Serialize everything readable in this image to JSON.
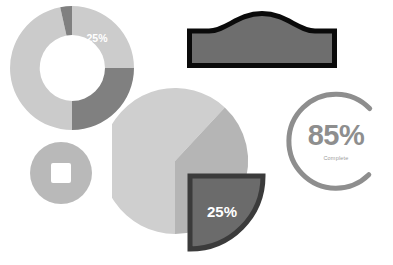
{
  "canvas": {
    "width": 393,
    "height": 265,
    "background": "#ffffff"
  },
  "palette": {
    "light_gray": "#cccccc",
    "lighter_gray": "#d4d4d4",
    "mid_gray": "#b0b0b0",
    "dark_gray": "#787878",
    "darker_gray": "#6e6e6e",
    "outline_dark": "#3b3b3b",
    "black": "#0a0a0a",
    "ring_gray": "#8e8e8e",
    "white": "#ffffff"
  },
  "widgets": {
    "donut_chart": {
      "name": "donut-chart",
      "label": "25%",
      "label_color": "#ffffff",
      "center_x": 64,
      "center_y": 64,
      "outer_radius": 62,
      "inner_radius": 33,
      "segments": [
        {
          "name": "segment-light-top-right",
          "value": 25,
          "start_deg": 0,
          "end_deg": 90,
          "color": "#cccccc"
        },
        {
          "name": "segment-dark-right",
          "value": 25,
          "start_deg": 90,
          "end_deg": 180,
          "color": "#808080"
        },
        {
          "name": "segment-light-left",
          "value": 28,
          "start_deg": 180,
          "end_deg": 281,
          "color": "#cbcbcb"
        },
        {
          "name": "segment-dark-top-left",
          "value": 22,
          "start_deg": 281,
          "end_deg": 360,
          "color": "#808080"
        }
      ]
    },
    "arch_shape": {
      "name": "arch-shape",
      "fill": "#6e6e6e",
      "stroke": "#0a0a0a",
      "stroke_width": 5
    },
    "pie_chart": {
      "name": "pie-chart",
      "center_x": 63,
      "center_y": 75,
      "radius": 73,
      "exploded_label": "25%",
      "exploded_label_color": "#ffffff",
      "slices": [
        {
          "name": "slice-light-major",
          "value": 62,
          "start_deg": 90,
          "end_deg": 313,
          "color": "#cfcfcf"
        },
        {
          "name": "slice-mid",
          "value": 13,
          "start_deg": 313,
          "end_deg": 360,
          "color": "#b5b5b5"
        },
        {
          "name": "slice-exploded",
          "value": 25,
          "start_deg": 0,
          "end_deg": 90,
          "color": "#6b6b6b",
          "stroke": "#3b3b3b",
          "exploded": true
        }
      ]
    },
    "stop_button": {
      "name": "stop-button",
      "circle_color": "#b9b9b9",
      "square_color": "#ffffff"
    },
    "progress_ring": {
      "name": "progress-ring",
      "value_text": "85%",
      "label_text": "Complete",
      "percent": 85,
      "track_color": "#ffffff",
      "arc_color": "#8e8e8e",
      "value_color": "#8e8e8e",
      "label_color": "#9b9b9b",
      "stroke_width": 5,
      "radius": 47
    }
  }
}
